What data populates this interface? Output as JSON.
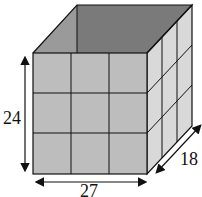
{
  "diagram": {
    "type": "open rectangular box divided into 3x3x3 grid",
    "dimensions": {
      "height": "24",
      "width": "27",
      "depth": "18"
    },
    "colors": {
      "front_face": "#bdbdbd",
      "side_face": "#d9d9d9",
      "interior_back": "#7a7a7a",
      "interior_side": "#9a9a9a",
      "lines": "#111111"
    }
  }
}
